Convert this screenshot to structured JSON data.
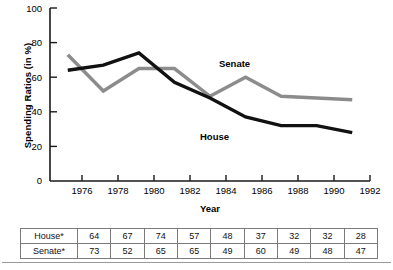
{
  "chart_data": {
    "type": "line",
    "title": "",
    "xlabel": "Year",
    "ylabel": "Spending Ratios (in %)",
    "xlim": [
      1974,
      1992
    ],
    "ylim": [
      0,
      100
    ],
    "grid": false,
    "legend_position": "inline-annotation",
    "x": [
      1975,
      1977,
      1979,
      1981,
      1983,
      1985,
      1987,
      1989,
      1991
    ],
    "xticks": [
      "1976",
      "1978",
      "1980",
      "1982",
      "1984",
      "1986",
      "1988",
      "1990",
      "1992"
    ],
    "yticks": [
      "0",
      "20",
      "40",
      "60",
      "80",
      "100"
    ],
    "series": [
      {
        "name": "House",
        "label": "House",
        "color": "#111111",
        "values": [
          64,
          67,
          74,
          57,
          48,
          37,
          32,
          32,
          28
        ]
      },
      {
        "name": "Senate",
        "label": "Senate",
        "color": "#8c8c8c",
        "values": [
          73,
          52,
          65,
          65,
          49,
          60,
          49,
          48,
          47
        ]
      }
    ]
  },
  "table": {
    "rows": [
      {
        "label": "House*",
        "values": [
          "64",
          "67",
          "74",
          "57",
          "48",
          "37",
          "32",
          "32",
          "28"
        ]
      },
      {
        "label": "Senate*",
        "values": [
          "73",
          "52",
          "65",
          "65",
          "49",
          "60",
          "49",
          "48",
          "47"
        ]
      }
    ]
  }
}
